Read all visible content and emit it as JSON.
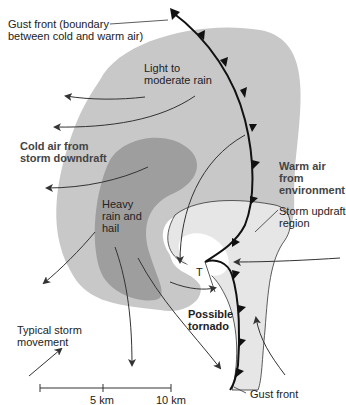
{
  "colors": {
    "light_rain": "#c8c8c8",
    "heavy_rain": "#9e9e9e",
    "updraft": "#e6e6e6",
    "lines": "#222222",
    "background": "#ffffff"
  },
  "labels": {
    "gust_front_top_line1": "Gust front (boundary",
    "gust_front_top_line2": "between cold and warm air)",
    "light_rain_line1": "Light to",
    "light_rain_line2": "moderate rain",
    "cold_air_line1": "Cold air from",
    "cold_air_line2": "storm downdraft",
    "warm_air_line1": "Warm air",
    "warm_air_line2": "from",
    "warm_air_line3": "environment",
    "heavy_rain_line1": "Heavy",
    "heavy_rain_line2": "rain and",
    "heavy_rain_line3": "hail",
    "updraft_line1": "Storm updraft",
    "updraft_line2": "region",
    "tornado_line1": "Possible",
    "tornado_line2": "tornado",
    "tornado_symbol": "T",
    "movement_line1": "Typical storm",
    "movement_line2": "movement",
    "gust_front_bottom": "Gust front"
  },
  "scale_bar": {
    "ticks": [
      "5 km",
      "10 km"
    ]
  }
}
